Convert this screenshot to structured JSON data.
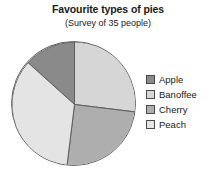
{
  "chart_data": {
    "type": "pie",
    "title": "Favourite types of pies",
    "subtitle": "(Survey of 35 people)",
    "total": 35,
    "units": "people",
    "grid": false,
    "legend_position": "right",
    "start_angle_deg": 0,
    "direction": "clockwise",
    "categories": [
      "Apple",
      "Banoffee",
      "Cherry",
      "Peach"
    ],
    "values": [
      5,
      9,
      9,
      12
    ],
    "slices": [
      {
        "label": "Apple",
        "value": 5,
        "percent": 14,
        "angle_deg": 48,
        "start_deg": 312,
        "end_deg": 360,
        "color": "#8a8a8a"
      },
      {
        "label": "Banoffee",
        "value": 9,
        "percent": 26,
        "angle_deg": 97,
        "start_deg": 0,
        "end_deg": 97,
        "color": "#d6d6d6"
      },
      {
        "label": "Cherry",
        "value": 9,
        "percent": 26,
        "angle_deg": 90,
        "start_deg": 97,
        "end_deg": 187,
        "color": "#aeaeae"
      },
      {
        "label": "Peach",
        "value": 12,
        "percent": 34,
        "angle_deg": 125,
        "start_deg": 187,
        "end_deg": 312,
        "color": "#e4e4e4"
      }
    ],
    "stroke_color": "#5d5d5d",
    "background": "#ffffff"
  },
  "legend": {
    "items": [
      {
        "label": "Apple",
        "color": "#8a8a8a"
      },
      {
        "label": "Banoffee",
        "color": "#d6d6d6"
      },
      {
        "label": "Cherry",
        "color": "#aeaeae"
      },
      {
        "label": "Peach",
        "color": "#e4e4e4"
      }
    ]
  }
}
